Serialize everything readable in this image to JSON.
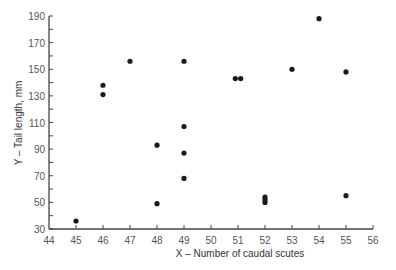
{
  "chart_data": {
    "type": "scatter",
    "title": "",
    "xlabel": "X – Number of caudal scutes",
    "ylabel": "Y – Tail length, mm",
    "xlim": [
      44,
      56
    ],
    "ylim": [
      30,
      190
    ],
    "x_ticks": [
      44,
      45,
      46,
      47,
      48,
      49,
      50,
      51,
      52,
      53,
      54,
      55,
      56
    ],
    "y_ticks": [
      30,
      50,
      70,
      90,
      110,
      130,
      150,
      170,
      190
    ],
    "y_minor_ticks": [
      40,
      60,
      80,
      100,
      120,
      140,
      160,
      180
    ],
    "grid": false,
    "legend": null,
    "marker_color": "#1a1a1a",
    "points": [
      {
        "x": 45,
        "y": 36
      },
      {
        "x": 46,
        "y": 138
      },
      {
        "x": 46,
        "y": 131
      },
      {
        "x": 47,
        "y": 156
      },
      {
        "x": 48,
        "y": 93
      },
      {
        "x": 48,
        "y": 49
      },
      {
        "x": 49,
        "y": 156
      },
      {
        "x": 49,
        "y": 107
      },
      {
        "x": 49,
        "y": 87
      },
      {
        "x": 49,
        "y": 68
      },
      {
        "x": 50.9,
        "y": 143
      },
      {
        "x": 51.1,
        "y": 143
      },
      {
        "x": 52,
        "y": 54
      },
      {
        "x": 52,
        "y": 52
      },
      {
        "x": 52,
        "y": 50
      },
      {
        "x": 53,
        "y": 150
      },
      {
        "x": 54,
        "y": 188
      },
      {
        "x": 55,
        "y": 148
      },
      {
        "x": 55,
        "y": 55
      }
    ]
  }
}
